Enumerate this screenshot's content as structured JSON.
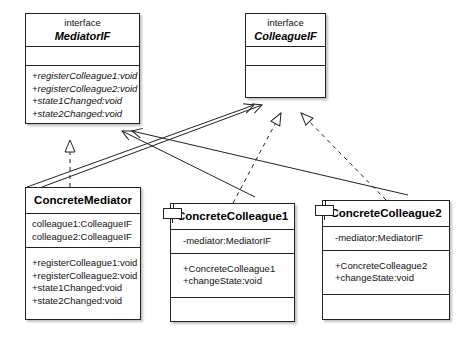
{
  "diagram": {
    "stereotype_label": "interface",
    "colors": {
      "line": "#222222",
      "fill": "#ffffff",
      "text": "#111111"
    },
    "classes": [
      {
        "id": "mediatorif",
        "stereotype": "interface",
        "name": "MediatorIF",
        "attributes": [],
        "operations": [
          "+registerColleague1:void",
          "+registerColleague2:void",
          "+state1Changed:void",
          "+state2Changed:void"
        ]
      },
      {
        "id": "colleagueif",
        "stereotype": "interface",
        "name": "ColleagueIF",
        "attributes": [],
        "operations": []
      },
      {
        "id": "concretemediator",
        "stereotype": "",
        "name": "ConcreteMediator",
        "attributes": [
          "colleague1:ColleagueIF",
          "colleague2:ColleagueIF"
        ],
        "operations": [
          "+registerColleague1:void",
          "+registerColleague2:void",
          "+state1Changed:void",
          "+state2Changed:void"
        ]
      },
      {
        "id": "concretecolleague1",
        "stereotype": "",
        "name": "ConcreteColleague1",
        "attributes": [
          "-mediator:MediatorIF"
        ],
        "operations": [
          "+ConcreteColleague1",
          "+changeState:void"
        ]
      },
      {
        "id": "concretecolleague2",
        "stereotype": "",
        "name": "ConcreteColleague2",
        "attributes": [
          "-mediator:MediatorIF"
        ],
        "operations": [
          "+ConcreteColleague2",
          "+changeState:void"
        ]
      }
    ],
    "relationships": [
      {
        "id": "rel-cm-realizes-mediatorif",
        "type": "realization",
        "from": "ConcreteMediator",
        "to": "MediatorIF",
        "style": "dashed",
        "arrow": "hollow-triangle"
      },
      {
        "id": "rel-cc1-realizes-colleagueif",
        "type": "realization",
        "from": "ConcreteColleague1",
        "to": "ColleagueIF",
        "style": "dashed",
        "arrow": "hollow-triangle"
      },
      {
        "id": "rel-cc2-realizes-colleagueif",
        "type": "realization",
        "from": "ConcreteColleague2",
        "to": "ColleagueIF",
        "style": "dashed",
        "arrow": "hollow-triangle"
      },
      {
        "id": "rel-cm-assoc-colleagueif-a",
        "type": "association",
        "from": "ConcreteMediator",
        "to": "ColleagueIF",
        "style": "solid",
        "arrow": "open"
      },
      {
        "id": "rel-cm-assoc-colleagueif-b",
        "type": "association",
        "from": "ConcreteMediator",
        "to": "ColleagueIF",
        "style": "solid",
        "arrow": "open"
      },
      {
        "id": "rel-cc1-assoc-mediatorif",
        "type": "association",
        "from": "ConcreteColleague1",
        "to": "MediatorIF",
        "style": "solid",
        "arrow": "open"
      },
      {
        "id": "rel-cc2-assoc-mediatorif",
        "type": "association",
        "from": "ConcreteColleague2",
        "to": "MediatorIF",
        "style": "solid",
        "arrow": "open"
      }
    ]
  }
}
